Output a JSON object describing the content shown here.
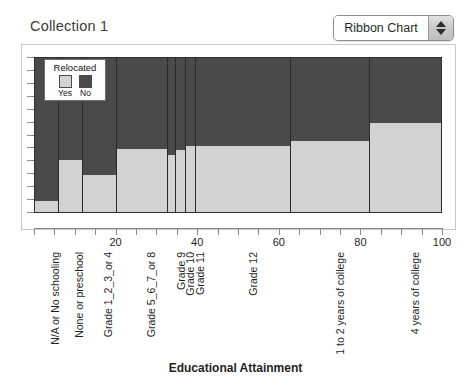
{
  "header": {
    "collection_title": "Collection 1",
    "chart_type_value": "Ribbon Chart",
    "stepper_up_icon": "triangle-up-icon",
    "stepper_down_icon": "triangle-down-icon"
  },
  "legend": {
    "title": "Relocated",
    "items": [
      {
        "label": "Yes",
        "color": "#d2d2d2"
      },
      {
        "label": "No",
        "color": "#4a4a4a"
      }
    ]
  },
  "chart_data": {
    "type": "bar",
    "orientation": "vertical-100-percent-stacked",
    "title": "Collection 1",
    "xlabel": "Educational Attainment",
    "ylabel": "",
    "xlim": [
      0,
      100
    ],
    "ylim": [
      0,
      100
    ],
    "grid": false,
    "legend_position": "inside-top-left",
    "x_tick_labels": [
      "20",
      "40",
      "60",
      "80",
      "100"
    ],
    "x_tick_values": [
      20,
      40,
      60,
      80,
      100
    ],
    "x_minor_tick_values": [
      0,
      5,
      10,
      15,
      20,
      25,
      30,
      35,
      40,
      45,
      50,
      55,
      60,
      65,
      70,
      75,
      80,
      85,
      90,
      95,
      100
    ],
    "y_tick_count": 13,
    "categories": [
      "N/A or No schooling",
      "None or preschool",
      "Grade 1_2_3_or 4",
      "Grade 5_6_7_or 8",
      "Grade 9",
      "Grade 10",
      "Grade 11",
      "Grade 12",
      "1 to 2 years of college",
      "4 years of college"
    ],
    "category_widths_percent": [
      5.9,
      5.9,
      8.6,
      12.5,
      2.0,
      2.4,
      2.5,
      23.3,
      19.4,
      17.6
    ],
    "category_x_boundaries_percent": [
      0,
      5.9,
      11.8,
      20.3,
      32.8,
      34.8,
      37.3,
      39.7,
      63.0,
      82.4,
      100.0
    ],
    "series": [
      {
        "name": "Yes",
        "color": "#d2d2d2",
        "values": [
          7,
          34,
          24,
          41,
          37,
          40,
          43,
          43,
          46,
          58
        ]
      },
      {
        "name": "No",
        "color": "#4a4a4a",
        "values": [
          93,
          66,
          76,
          59,
          63,
          60,
          57,
          57,
          54,
          42
        ]
      }
    ]
  }
}
